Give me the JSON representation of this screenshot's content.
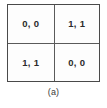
{
  "figure": {
    "caption": "(a)",
    "frame_color": "#4a4a4a",
    "divider_color": "#5a5a5a",
    "cell_background": "#fdfdfd",
    "text_color": "#2b2b2b"
  },
  "chart_data": {
    "type": "table",
    "title": "(a)",
    "xlabel": "",
    "ylabel": "",
    "columns": [
      "",
      ""
    ],
    "rows": [
      [
        "0, 0",
        "1, 1"
      ],
      [
        "1, 1",
        "0, 0"
      ]
    ],
    "cells": [
      {
        "row": 0,
        "col": 0,
        "value": "0, 0"
      },
      {
        "row": 0,
        "col": 1,
        "value": "1, 1"
      },
      {
        "row": 1,
        "col": 0,
        "value": "1, 1"
      },
      {
        "row": 1,
        "col": 1,
        "value": "0, 0"
      }
    ],
    "grid": true,
    "legend": "none"
  }
}
